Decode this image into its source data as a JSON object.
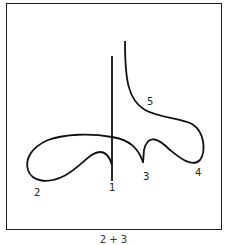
{
  "diagram": {
    "labels": {
      "l1": "1",
      "l2": "2",
      "l3": "3",
      "l4": "4",
      "l5": "5"
    },
    "caption": "2 + 3",
    "stroke_color": "#111111"
  }
}
